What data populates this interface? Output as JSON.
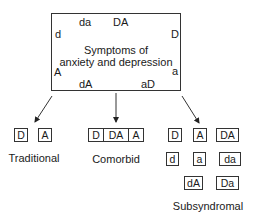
{
  "main": {
    "title_line1": "Symptoms of",
    "title_line2": "anxiety and depression",
    "corner_labels": {
      "top_left": "da",
      "top_right": "DA",
      "left_upper": "d",
      "right_upper": "D",
      "left_lower": "A",
      "right_lower": "a",
      "bottom_left": "dA",
      "bottom_right": "aD"
    }
  },
  "groups": {
    "traditional": {
      "caption": "Traditional",
      "boxes": [
        "D",
        "A"
      ]
    },
    "comorbid": {
      "caption": "Comorbid",
      "segments": [
        "D",
        "DA",
        "A"
      ]
    },
    "subsyndromal": {
      "caption": "Subsyndromal",
      "rows": [
        [
          "D",
          "A",
          "DA"
        ],
        [
          "d",
          "a",
          "da"
        ],
        [
          "dA",
          "Da"
        ]
      ]
    }
  },
  "colors": {
    "stroke": "#333333",
    "text": "#1a1a1a",
    "background": "#ffffff"
  }
}
